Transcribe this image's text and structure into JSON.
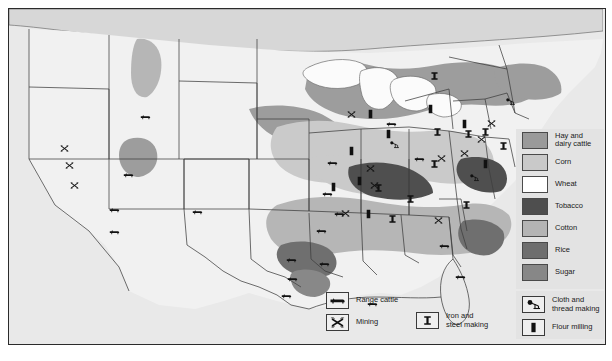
{
  "map": {
    "title": "Agriculture and industry of the United States",
    "frame": {
      "border_color": "#2b2b2b",
      "ocean_color": "#e9e9e9",
      "land_color": "#f4f4f4"
    }
  },
  "legend_crops": {
    "items": [
      {
        "label": "Hay and\ndairy cattle",
        "color": "#9a9a9a",
        "icon": "color-swatch"
      },
      {
        "label": "Corn",
        "color": "#c9c9c9",
        "icon": "color-swatch"
      },
      {
        "label": "Wheat",
        "color": "#ffffff",
        "icon": "color-swatch"
      },
      {
        "label": "Tobacco",
        "color": "#4e4e4e",
        "icon": "color-swatch"
      },
      {
        "label": "Cotton",
        "color": "#b4b4b4",
        "icon": "color-swatch"
      },
      {
        "label": "Rice",
        "color": "#6e6e6e",
        "icon": "color-swatch"
      },
      {
        "label": "Sugar",
        "color": "#878787",
        "icon": "color-swatch"
      }
    ]
  },
  "legend_symbols": {
    "left_group": [
      {
        "label": "Range cattle",
        "icon": "cow-icon"
      },
      {
        "label": "Mining",
        "icon": "crossed-picks-icon"
      }
    ],
    "middle_group": [
      {
        "label": "Iron and\nsteel making",
        "icon": "ingot-icon"
      }
    ],
    "right_group": [
      {
        "label": "Cloth and\nthread making",
        "icon": "spinning-wheel-icon"
      },
      {
        "label": "Flour milling",
        "icon": "flour-sack-icon"
      }
    ]
  },
  "map_markers": {
    "range_cattle": [
      {
        "x": 131,
        "y": 103
      },
      {
        "x": 114,
        "y": 161
      },
      {
        "x": 183,
        "y": 198
      },
      {
        "x": 405,
        "y": 145
      },
      {
        "x": 100,
        "y": 196
      },
      {
        "x": 100,
        "y": 218
      },
      {
        "x": 277,
        "y": 246
      },
      {
        "x": 278,
        "y": 265
      },
      {
        "x": 272,
        "y": 282
      },
      {
        "x": 307,
        "y": 217
      },
      {
        "x": 310,
        "y": 250
      },
      {
        "x": 446,
        "y": 263
      },
      {
        "x": 318,
        "y": 149
      },
      {
        "x": 313,
        "y": 180
      },
      {
        "x": 325,
        "y": 200
      },
      {
        "x": 377,
        "y": 110
      },
      {
        "x": 430,
        "y": 232
      },
      {
        "x": 358,
        "y": 290
      }
    ],
    "mining": [
      {
        "x": 50,
        "y": 135
      },
      {
        "x": 55,
        "y": 152
      },
      {
        "x": 60,
        "y": 172
      },
      {
        "x": 337,
        "y": 101
      },
      {
        "x": 356,
        "y": 155
      },
      {
        "x": 360,
        "y": 172
      },
      {
        "x": 424,
        "y": 207
      },
      {
        "x": 477,
        "y": 110
      },
      {
        "x": 467,
        "y": 126
      },
      {
        "x": 450,
        "y": 140
      },
      {
        "x": 427,
        "y": 145
      },
      {
        "x": 331,
        "y": 200
      }
    ],
    "iron_and_steel": [
      {
        "x": 421,
        "y": 62
      },
      {
        "x": 424,
        "y": 118
      },
      {
        "x": 455,
        "y": 120
      },
      {
        "x": 472,
        "y": 118
      },
      {
        "x": 490,
        "y": 132
      },
      {
        "x": 421,
        "y": 150
      },
      {
        "x": 453,
        "y": 191
      },
      {
        "x": 397,
        "y": 185
      },
      {
        "x": 379,
        "y": 205
      },
      {
        "x": 365,
        "y": 174
      }
    ],
    "cloth_and_thread": [
      {
        "x": 496,
        "y": 88
      },
      {
        "x": 460,
        "y": 164
      },
      {
        "x": 380,
        "y": 131
      }
    ],
    "flour_milling": [
      {
        "x": 357,
        "y": 100
      },
      {
        "x": 375,
        "y": 120
      },
      {
        "x": 417,
        "y": 95
      },
      {
        "x": 451,
        "y": 110
      },
      {
        "x": 338,
        "y": 137
      },
      {
        "x": 346,
        "y": 167
      },
      {
        "x": 355,
        "y": 200
      },
      {
        "x": 472,
        "y": 150
      },
      {
        "x": 320,
        "y": 173
      }
    ]
  },
  "chart_data": {
    "type": "map",
    "regions_legend": [
      "Hay and dairy cattle",
      "Corn",
      "Wheat",
      "Tobacco",
      "Cotton",
      "Rice",
      "Sugar"
    ],
    "symbols_legend": [
      "Range cattle",
      "Mining",
      "Iron and steel making",
      "Cloth and thread making",
      "Flour milling"
    ]
  }
}
